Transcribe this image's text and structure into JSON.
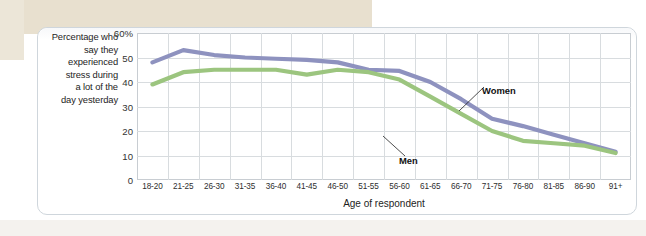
{
  "axis_caption": {
    "lines": [
      "Percentage who",
      "say they",
      "experienced",
      "stress during",
      "a lot of the",
      "day yesterday"
    ]
  },
  "chart_data": {
    "type": "line",
    "title": "",
    "subtitle": "",
    "xlabel": "Age of respondent",
    "ylabel": "Percentage who say they experienced stress during a lot of the day yesterday",
    "categories": [
      "18-20",
      "21-25",
      "26-30",
      "31-35",
      "36-40",
      "41-45",
      "46-50",
      "51-55",
      "56-60",
      "61-65",
      "66-70",
      "71-75",
      "76-80",
      "81-85",
      "86-90",
      "91+"
    ],
    "ytick_labels": [
      "60%",
      "50",
      "40",
      "30",
      "20",
      "10",
      "0"
    ],
    "ytick_values": [
      60,
      50,
      40,
      30,
      20,
      10,
      0
    ],
    "ylim": [
      0,
      60
    ],
    "grid": true,
    "legend_position": "inline-annotations",
    "series": [
      {
        "name": "Women",
        "color": "#8e92bf",
        "values": [
          48,
          53,
          51,
          50,
          49.5,
          49,
          48,
          45,
          44.5,
          40,
          33,
          25,
          22,
          18.5,
          15,
          11.5
        ]
      },
      {
        "name": "Men",
        "color": "#9cc57f",
        "values": [
          39,
          44,
          45,
          45,
          45,
          43,
          45,
          44,
          41,
          34,
          27,
          20,
          16,
          15,
          14,
          11
        ]
      }
    ],
    "annotations": [
      {
        "text": "Women",
        "series": "Women",
        "anchor_category": "71-75"
      },
      {
        "text": "Men",
        "series": "Men",
        "anchor_category": "66-70"
      }
    ]
  }
}
